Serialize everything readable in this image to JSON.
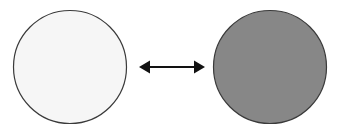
{
  "figure": {
    "type": "diagram",
    "title": "",
    "canvas": {
      "width": 344,
      "height": 134,
      "background_color": "#ffffff"
    },
    "shapes": [
      {
        "id": "left-circle",
        "name": "light-circle",
        "kind": "circle",
        "label": "",
        "cx": 70,
        "cy": 67,
        "r": 56.5,
        "fill_color": "#f6f6f6",
        "stroke_color": "#3a3a3a",
        "stroke_width": 1.2
      },
      {
        "id": "right-circle",
        "name": "gray-circle",
        "kind": "circle",
        "label": "",
        "cx": 270,
        "cy": 67,
        "r": 56.5,
        "fill_color": "#878787",
        "stroke_color": "#3a3a3a",
        "stroke_width": 1.2
      }
    ],
    "connectors": [
      {
        "id": "bidirectional-arrow",
        "name": "double-headed-arrow",
        "kind": "arrow",
        "label": "",
        "direction": "bidirectional",
        "x_start": 139,
        "x_end": 205,
        "y": 67,
        "color": "#121212",
        "shaft_width": 2.2,
        "head_length": 11,
        "head_half_width": 6.5
      }
    ]
  }
}
